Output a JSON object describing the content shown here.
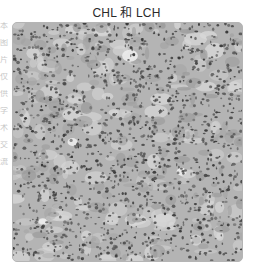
{
  "figure": {
    "title": "CHL 和 LCH",
    "side_text": [
      "本",
      "图",
      "片",
      "仅",
      "供",
      "学",
      "术",
      "交",
      "流"
    ],
    "image": {
      "kind": "histology-micrograph",
      "description": "Grayscale H&E-style tissue section with densely packed dark nuclei",
      "colors": {
        "background": "#b4b4b4",
        "light_tissue": "#d8d8d8",
        "mid_tissue": "#9a9a9a",
        "nucleus_dark": "#3a3a3a",
        "nucleus_mid": "#5c5c5c",
        "border": "#b5b5b5"
      },
      "texture": {
        "seed": 20240517,
        "light_patches": 140,
        "mid_patches": 160,
        "nuclei": 1500,
        "clear_spaces": [
          {
            "x": 118,
            "y": 33,
            "rx": 8,
            "ry": 6
          },
          {
            "x": 60,
            "y": 120,
            "rx": 5,
            "ry": 4
          },
          {
            "x": 170,
            "y": 150,
            "rx": 5,
            "ry": 4
          },
          {
            "x": 30,
            "y": 200,
            "rx": 4,
            "ry": 3
          }
        ]
      }
    }
  }
}
